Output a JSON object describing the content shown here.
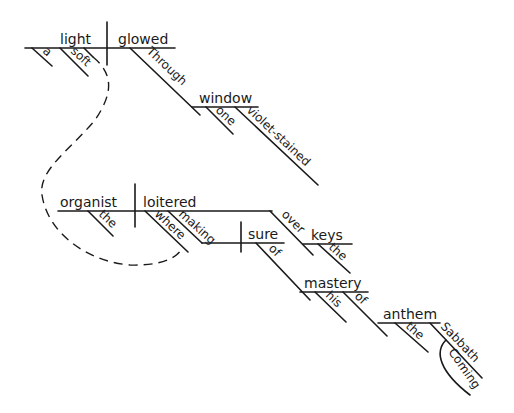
{
  "diagram": {
    "type": "sentence-diagram",
    "clause1": {
      "subject": "light",
      "verb": "glowed",
      "subject_modifiers": [
        "a",
        "soft"
      ],
      "prepositional_phrase": {
        "preposition": "Through",
        "object": "window",
        "object_modifiers": [
          "one",
          "violet-stained"
        ]
      }
    },
    "clause2": {
      "subject": "organist",
      "verb": "loitered",
      "subject_modifiers": [
        "the"
      ],
      "relative_adverb": "where",
      "participle_phrase": {
        "participle": "making",
        "object": "sure",
        "prep1": {
          "preposition": "of",
          "object": "mastery",
          "modifier": "his",
          "prep": {
            "preposition": "of",
            "object": "anthem",
            "modifier": "the",
            "appositive_modifier": {
              "word": "Sabbath",
              "sub": "Coming"
            }
          }
        }
      },
      "prep_over": {
        "preposition": "over",
        "object": "keys",
        "modifier": "the"
      }
    },
    "connector": "dashed-line"
  }
}
